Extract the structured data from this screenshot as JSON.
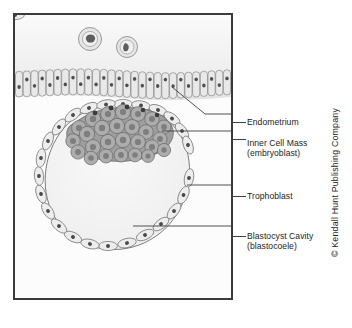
{
  "figure": {
    "panel": {
      "border_color": "#3b3b3b",
      "background_color": "#fbfbfb"
    },
    "colors": {
      "lumen_tint": "#f0f0f0",
      "epithelium_fill": "#e2e2e2",
      "epithelium_stroke": "#8d8d8d",
      "nucleus_dark": "#4a4a4a",
      "inner_cell_mass_fill": "#a8a8a8",
      "inner_cell_mass_stroke": "#6e6e6e",
      "inner_cell_mass_nucleus": "#7c7c7c",
      "trophoblast_fill": "#ececec",
      "trophoblast_stroke": "#7d7d7d",
      "cavity_fill": "#f4f4f4",
      "leader_line": "#404040",
      "text": "#1d1d1d"
    }
  },
  "labels": {
    "endometrium": {
      "text": "Endometrium"
    },
    "inner_cell_mass": {
      "text": "Inner Cell Mass",
      "subtext": "(embryoblast)"
    },
    "trophoblast": {
      "text": "Trophoblast"
    },
    "blastocyst_cavity": {
      "text": "Blastocyst Cavity",
      "subtext": "(blastocoele)"
    }
  },
  "structures": {
    "free_cells": [
      {
        "name": "free-floating-cell-1",
        "cx": 88,
        "cy": 37
      },
      {
        "name": "free-floating-cell-2",
        "cx": 125,
        "cy": 45
      }
    ],
    "epithelium": {
      "name": "endometrial-epithelium",
      "cell_count": 28
    },
    "inner_cell_mass": {
      "name": "inner-cell-mass-cluster",
      "cell_count": 34
    },
    "trophoblast": {
      "name": "trophoblast-ring",
      "cell_count": 26
    },
    "blastocyst_cavity": {
      "name": "blastocyst-cavity"
    }
  },
  "credit": {
    "text": "© Kendall Hunt Publishing Company"
  }
}
